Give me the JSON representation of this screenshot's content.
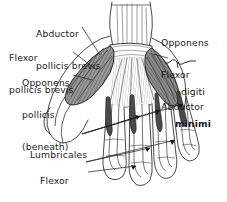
{
  "figure": {
    "type": "anatomical-line-drawing",
    "background_color": "#ffffff",
    "ink_color": "#1a1a1a",
    "muscle_shading_color": "#6b6b6b"
  },
  "labels": {
    "abductor_pollicis_brevis": {
      "line1": "Abductor",
      "line2": "pollicis brevis"
    },
    "flexor_pollicis_brevis": {
      "line1": "Flexor",
      "line2": "pollicis brevis"
    },
    "opponens_pollicis": {
      "line1": "Opponens",
      "line2": "pollicis",
      "line3": "(beneath)"
    },
    "hypothenar_group": {
      "line1": "Opponens",
      "line2": "Flexor",
      "line3": "Abductor",
      "target_line1": "digiti",
      "target_line2": "minimi"
    },
    "lumbricales": {
      "line1": "Lumbricales"
    },
    "flexor_digitorum_profundus": {
      "line1": "Flexor",
      "line2": "digitorum",
      "line3": "profundus"
    }
  }
}
